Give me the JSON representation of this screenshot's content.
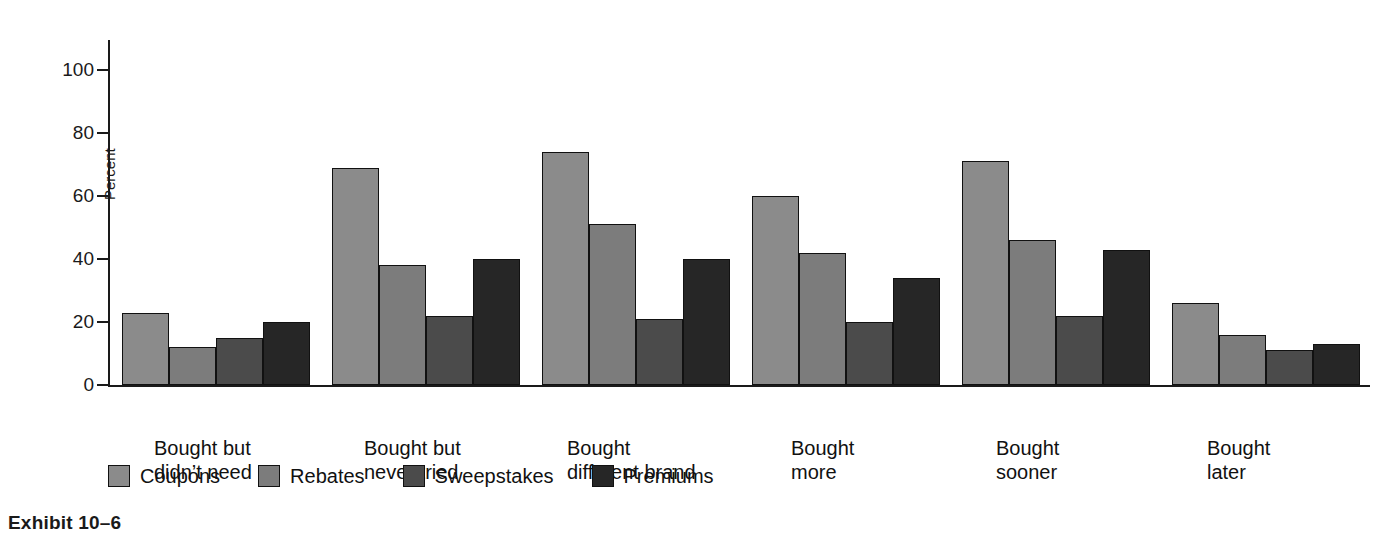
{
  "caption": "Exhibit 10–6",
  "colors": {
    "coupons": "#8b8b8b",
    "rebates": "#7c7c7c",
    "sweepstakes": "#4b4b4b",
    "premiums": "#262626",
    "axis": "#1a1a1a",
    "background": "#ffffff"
  },
  "axis": {
    "y_title": "Percent",
    "y_ticks": [
      "0",
      "20",
      "40",
      "60",
      "80",
      "100"
    ]
  },
  "legend": {
    "items": [
      {
        "label": "Coupons",
        "swatch": "legend-swatch-coupons"
      },
      {
        "label": "Rebates",
        "swatch": "legend-swatch-rebates"
      },
      {
        "label": "Sweepstakes",
        "swatch": "legend-swatch-sweepstakes"
      },
      {
        "label": "Premiums",
        "swatch": "legend-swatch-premiums"
      }
    ]
  },
  "categories_display": [
    "Bought but\ndidn’t need",
    "Bought but\nnever tried",
    "Bought\ndifferent brand",
    "Bought\nmore",
    "Bought\nsooner",
    "Bought\nlater"
  ],
  "chart_data": {
    "type": "bar",
    "title": "Exhibit 10–6",
    "xlabel": "",
    "ylabel": "Percent",
    "ylim": [
      0,
      100
    ],
    "yticks": [
      0,
      20,
      40,
      60,
      80,
      100
    ],
    "grid": false,
    "legend_position": "bottom-left",
    "categories": [
      "Bought but didn’t need",
      "Bought but never tried",
      "Bought different brand",
      "Bought more",
      "Bought sooner",
      "Bought later"
    ],
    "series": [
      {
        "name": "Coupons",
        "values": [
          23,
          69,
          74,
          60,
          71,
          26
        ]
      },
      {
        "name": "Rebates",
        "values": [
          12,
          38,
          51,
          42,
          46,
          16
        ]
      },
      {
        "name": "Sweepstakes",
        "values": [
          15,
          22,
          21,
          20,
          22,
          11
        ]
      },
      {
        "name": "Premiums",
        "values": [
          20,
          40,
          40,
          34,
          43,
          13
        ]
      }
    ]
  }
}
